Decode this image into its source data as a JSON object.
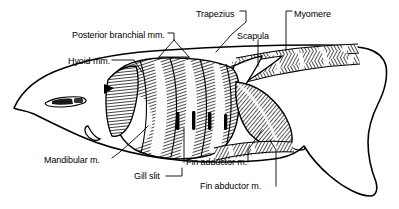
{
  "figure": {
    "background_color": "#ffffff",
    "ink_color": "#000000",
    "labels": [
      {
        "key": "trapezius",
        "text": "Trapezius",
        "x": 196,
        "y": 13
      },
      {
        "key": "myomere",
        "text": "Myomere",
        "x": 294,
        "y": 13
      },
      {
        "key": "posterior_branchial",
        "text": "Posterior branchial mm.",
        "x": 72,
        "y": 36
      },
      {
        "key": "scapula",
        "text": "Scapula",
        "x": 237,
        "y": 35
      },
      {
        "key": "hyoid",
        "text": "Hyoid mm.",
        "x": 68,
        "y": 62
      },
      {
        "key": "mandibular",
        "text": "Mandibular m.",
        "x": 44,
        "y": 160
      },
      {
        "key": "fin_adductor",
        "text": "Fin adductor m.",
        "x": 186,
        "y": 163
      },
      {
        "key": "gill_slit",
        "text": "Gill slit",
        "x": 138,
        "y": 177
      },
      {
        "key": "fin_abductor",
        "text": "Fin abductor m.",
        "x": 207,
        "y": 187
      }
    ],
    "anatomy_parts": [
      "head",
      "eye",
      "mouth",
      "spiracle",
      "hyoid-muscles",
      "posterior-branchial-muscles",
      "gill-slits",
      "trapezius",
      "scapula",
      "myomeres",
      "pectoral-fin",
      "fin-adductor",
      "fin-abductor",
      "pelvic-fin",
      "caudal-peduncle"
    ]
  }
}
